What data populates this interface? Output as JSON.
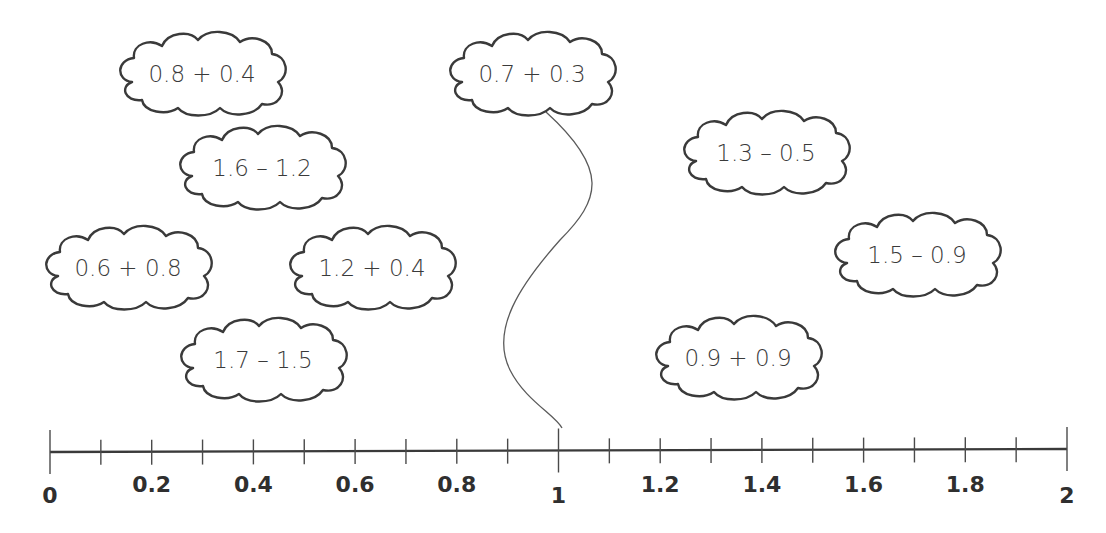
{
  "diagram": {
    "type": "number-line-matching",
    "number_line": {
      "min": 0,
      "max": 2,
      "step": 0.1,
      "labels": [
        "0",
        "0.2",
        "0.4",
        "0.6",
        "0.8",
        "1",
        "1.2",
        "1.4",
        "1.6",
        "1.8",
        "2"
      ],
      "major_labels": [
        "0",
        "1",
        "2"
      ]
    },
    "clouds": [
      {
        "id": "c1",
        "expression": "0.8 + 0.4",
        "cx": 202,
        "cy": 74
      },
      {
        "id": "c2",
        "expression": "0.7 + 0.3",
        "cx": 532,
        "cy": 74,
        "connected_to": "1"
      },
      {
        "id": "c3",
        "expression": "1.6 – 1.2",
        "cx": 262,
        "cy": 168
      },
      {
        "id": "c4",
        "expression": "1.3 – 0.5",
        "cx": 766,
        "cy": 153
      },
      {
        "id": "c5",
        "expression": "0.6 + 0.8",
        "cx": 128,
        "cy": 268
      },
      {
        "id": "c6",
        "expression": "1.2 + 0.4",
        "cx": 372,
        "cy": 268
      },
      {
        "id": "c7",
        "expression": "1.5 – 0.9",
        "cx": 917,
        "cy": 255
      },
      {
        "id": "c8",
        "expression": "1.7 – 1.5",
        "cx": 263,
        "cy": 360
      },
      {
        "id": "c9",
        "expression": "0.9 + 0.9",
        "cx": 738,
        "cy": 358
      }
    ],
    "example_connector": {
      "from": "0.7 + 0.3",
      "to": "1"
    }
  }
}
